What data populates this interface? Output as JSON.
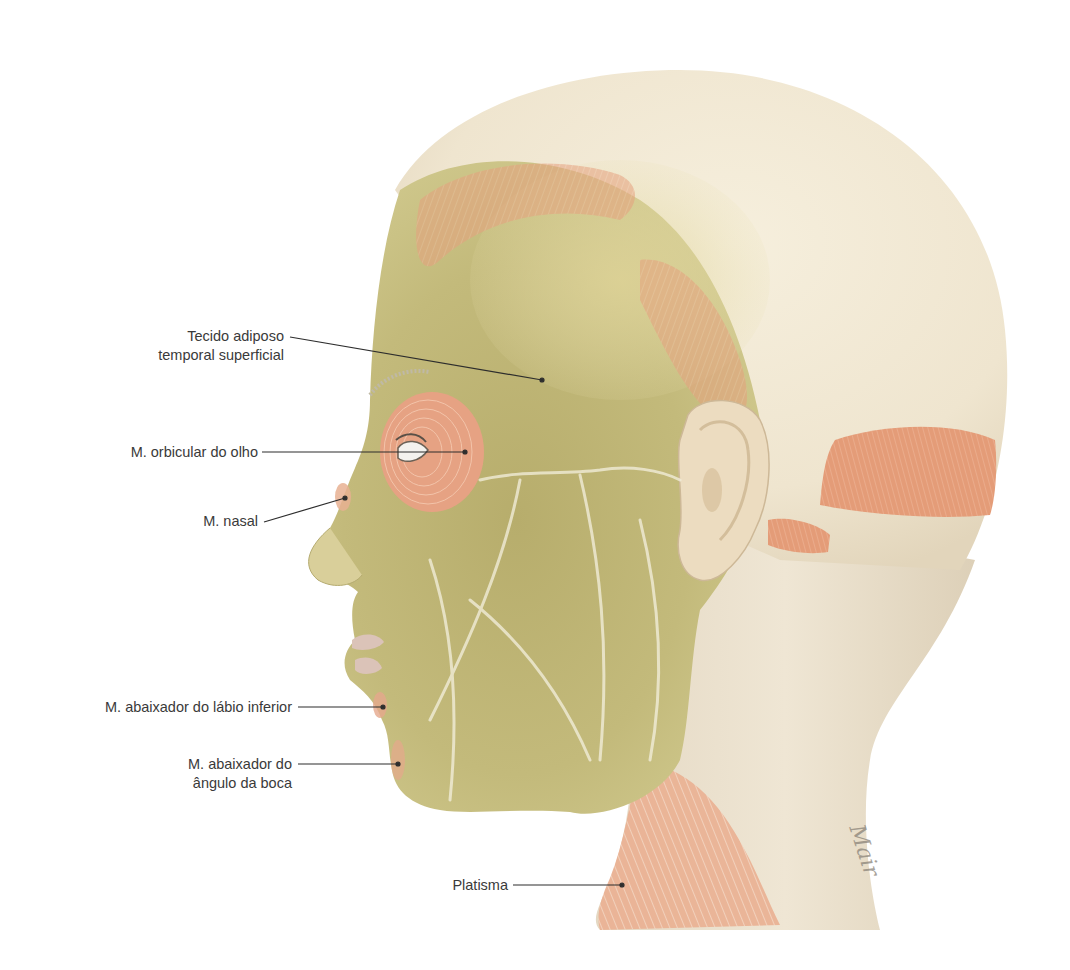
{
  "figure": {
    "colors": {
      "background": "#ffffff",
      "skin_scalp": "#efe6d3",
      "fat_tissue": "#c2b978",
      "muscle": "#e7a07d",
      "vessels": "#f3efd9",
      "leader_line": "#2d2d2d",
      "label_text": "#3a3a3a"
    },
    "signature": "Mair"
  },
  "labels": [
    {
      "id": "tecido-adiposo",
      "lines": [
        "Tecido adiposo",
        "temporal superficial"
      ],
      "anchor": [
        542,
        380
      ]
    },
    {
      "id": "orbicular-olho",
      "lines": [
        "M. orbicular do olho"
      ],
      "anchor": [
        465,
        452
      ]
    },
    {
      "id": "nasal",
      "lines": [
        "M. nasal"
      ],
      "anchor": [
        345,
        498
      ]
    },
    {
      "id": "abaixador-labio",
      "lines": [
        "M. abaixador do lábio inferior"
      ],
      "anchor": [
        383,
        707
      ]
    },
    {
      "id": "abaixador-angulo",
      "lines": [
        "M. abaixador do",
        "ângulo da boca"
      ],
      "anchor": [
        398,
        764
      ]
    },
    {
      "id": "platisma",
      "lines": [
        "Platisma"
      ],
      "anchor": [
        622,
        885
      ]
    }
  ]
}
